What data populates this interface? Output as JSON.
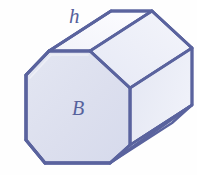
{
  "figure": {
    "name": "octagonal-prism",
    "kind": "3d-solid-geometry-diagram",
    "background_color": "#fefefe",
    "edge_color": "#5a639e",
    "edge_color_light": "#7b84b8",
    "fill_front": "#dfe2f0",
    "fill_top_left": "#fbfbfe",
    "fill_top_right": "#eef0f8",
    "fill_side": "#e7e9f4",
    "fill_bevel": "#eceef7",
    "label_color": "#56619c"
  },
  "labels": {
    "height": "h",
    "base": "B"
  },
  "annotations": {
    "height_meaning": "h labels the lateral edge (length) of the prism",
    "base_meaning": "B labels the area of the octagonal base face"
  },
  "geometry": {
    "front_face_vertices": [
      [
        26,
        75
      ],
      [
        49,
        51
      ],
      [
        90,
        51
      ],
      [
        130,
        88
      ],
      [
        130,
        145
      ],
      [
        110,
        163
      ],
      [
        45,
        163
      ],
      [
        26,
        140
      ]
    ],
    "back_offset": [
      62,
      -40
    ],
    "visible_faces": [
      "front-base",
      "top-left",
      "top-right",
      "right-side",
      "bottom-right-bevel"
    ]
  }
}
